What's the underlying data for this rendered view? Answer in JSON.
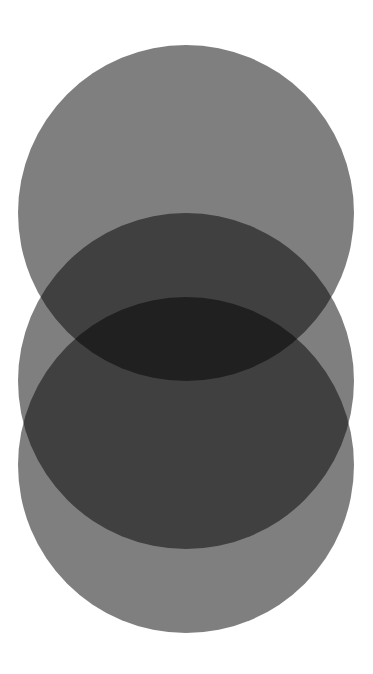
{
  "canvas": {
    "width": 373,
    "height": 674,
    "background_color": "#ffffff",
    "title": "Three Overlapping Translucent Circles"
  },
  "palette": {
    "background": "#ffffff",
    "single_overlap": "#808080",
    "double_overlap": "#3a3a3a",
    "triple_overlap": "#1a1a1a",
    "circle_base": "#000000"
  },
  "chart_data": {
    "type": "diagram",
    "subtype": "venn-three-circle-vertical",
    "title": "Three Overlapping Translucent Circles",
    "xlabel": "",
    "ylabel": "",
    "grid": false,
    "legend": "none",
    "blend_mode": "multiply",
    "background": "#ffffff",
    "shapes": [
      {
        "name": "circle-top",
        "label": "Top Circle",
        "cx": 186,
        "cy": 213,
        "r": 168,
        "fill": "#000000",
        "opacity": 0.5,
        "top": 45,
        "bottom": 381,
        "left": 18,
        "right": 354
      },
      {
        "name": "circle-middle",
        "label": "Middle Circle",
        "cx": 186,
        "cy": 381,
        "r": 168,
        "fill": "#000000",
        "opacity": 0.5,
        "top": 213,
        "bottom": 549,
        "left": 18,
        "right": 354
      },
      {
        "name": "circle-bottom",
        "label": "Bottom Circle",
        "cx": 186,
        "cy": 465,
        "r": 168,
        "fill": "#000000",
        "opacity": 0.5,
        "top": 297,
        "bottom": 633,
        "left": 18,
        "right": 354
      }
    ],
    "regions": [
      {
        "name": "single",
        "count": 1,
        "color": "#808080"
      },
      {
        "name": "double",
        "count": 2,
        "color": "#3a3a3a"
      },
      {
        "name": "triple",
        "count": 3,
        "color": "#1a1a1a"
      }
    ]
  }
}
